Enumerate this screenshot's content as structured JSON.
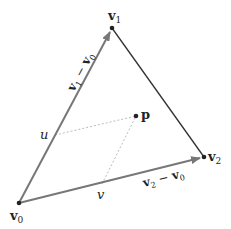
{
  "diagram": {
    "colors": {
      "edge": "#333333",
      "vector": "#777777",
      "dashed": "#aaaaaa",
      "point": "#222222"
    },
    "points": {
      "v0": {
        "label": "v",
        "sub": "0",
        "x": 19,
        "y": 203
      },
      "v1": {
        "label": "v",
        "sub": "1",
        "x": 112,
        "y": 28
      },
      "v2": {
        "label": "v",
        "sub": "2",
        "x": 204,
        "y": 157
      },
      "p": {
        "label": "p",
        "x": 136,
        "y": 116
      }
    },
    "param_labels": {
      "u": "u",
      "v": "v"
    },
    "vector_labels": {
      "e1": {
        "a": "v",
        "a_sub": "1",
        "op": " − ",
        "b": "v",
        "b_sub": "0"
      },
      "e2": {
        "a": "v",
        "a_sub": "2",
        "op": " − ",
        "b": "v",
        "b_sub": "0"
      }
    }
  }
}
